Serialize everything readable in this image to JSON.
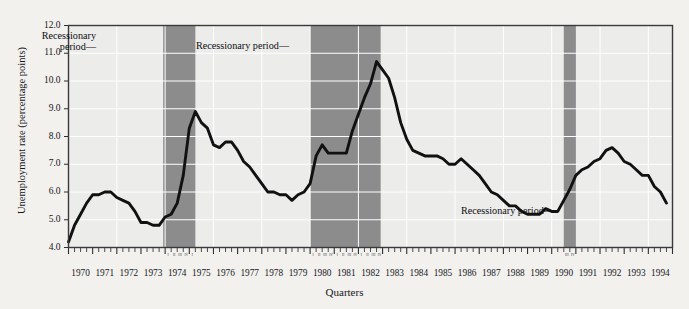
{
  "chart_data": {
    "type": "line",
    "title": "",
    "xlabel": "Quarters",
    "ylabel": "Unemployment rate (percentage points)",
    "ylim": [
      4.0,
      12.0
    ],
    "ytick_values": [
      4.0,
      5.0,
      6.0,
      7.0,
      8.0,
      9.0,
      10.0,
      11.0,
      12.0
    ],
    "ytick_labels": [
      "4.0",
      "5.0",
      "6.0",
      "7.0",
      "8.0",
      "9.0",
      "10.0",
      "11.0",
      "12.0"
    ],
    "xlim": [
      1970.0,
      1995.0
    ],
    "xtick_labels": [
      "1970",
      "1971",
      "1972",
      "1973",
      "1974",
      "1975",
      "1976",
      "1977",
      "1978",
      "1979",
      "1980",
      "1981",
      "1982",
      "1983",
      "1984",
      "1985",
      "1986",
      "1987",
      "1988",
      "1989",
      "1990",
      "1991",
      "1992",
      "1993",
      "1994"
    ],
    "grid": true,
    "legend": "none",
    "minor_ticks": "quarterly",
    "quarter_marks": [
      "I",
      "II",
      "III",
      "IV"
    ],
    "series": [
      {
        "name": "Unemployment rate",
        "color": "#111111",
        "x": [
          1970.0,
          1970.25,
          1970.5,
          1970.75,
          1971.0,
          1971.25,
          1971.5,
          1971.75,
          1972.0,
          1972.25,
          1972.5,
          1972.75,
          1973.0,
          1973.25,
          1973.5,
          1973.75,
          1974.0,
          1974.25,
          1974.5,
          1974.75,
          1975.0,
          1975.25,
          1975.5,
          1975.75,
          1976.0,
          1976.25,
          1976.5,
          1976.75,
          1977.0,
          1977.25,
          1977.5,
          1977.75,
          1978.0,
          1978.25,
          1978.5,
          1978.75,
          1979.0,
          1979.25,
          1979.5,
          1979.75,
          1980.0,
          1980.25,
          1980.5,
          1980.75,
          1981.0,
          1981.25,
          1981.5,
          1981.75,
          1982.0,
          1982.25,
          1982.5,
          1982.75,
          1983.0,
          1983.25,
          1983.5,
          1983.75,
          1984.0,
          1984.25,
          1984.5,
          1984.75,
          1985.0,
          1985.25,
          1985.5,
          1985.75,
          1986.0,
          1986.25,
          1986.5,
          1986.75,
          1987.0,
          1987.25,
          1987.5,
          1987.75,
          1988.0,
          1988.25,
          1988.5,
          1988.75,
          1989.0,
          1989.25,
          1989.5,
          1989.75,
          1990.0,
          1990.25,
          1990.5,
          1990.75,
          1991.0,
          1991.25,
          1991.5,
          1991.75,
          1992.0,
          1992.25,
          1992.5,
          1992.75,
          1993.0,
          1993.25,
          1993.5,
          1993.75,
          1994.0,
          1994.25,
          1994.5,
          1994.75
        ],
        "y": [
          4.2,
          4.8,
          5.2,
          5.6,
          5.9,
          5.9,
          6.0,
          6.0,
          5.8,
          5.7,
          5.6,
          5.3,
          4.9,
          4.9,
          4.8,
          4.8,
          5.1,
          5.2,
          5.6,
          6.6,
          8.3,
          8.9,
          8.5,
          8.3,
          7.7,
          7.6,
          7.8,
          7.8,
          7.5,
          7.1,
          6.9,
          6.6,
          6.3,
          6.0,
          6.0,
          5.9,
          5.9,
          5.7,
          5.9,
          6.0,
          6.3,
          7.3,
          7.7,
          7.4,
          7.4,
          7.4,
          7.4,
          8.2,
          8.8,
          9.4,
          9.9,
          10.7,
          10.4,
          10.1,
          9.4,
          8.5,
          7.9,
          7.5,
          7.4,
          7.3,
          7.3,
          7.3,
          7.2,
          7.0,
          7.0,
          7.2,
          7.0,
          6.8,
          6.6,
          6.3,
          6.0,
          5.9,
          5.7,
          5.5,
          5.5,
          5.3,
          5.2,
          5.2,
          5.2,
          5.4,
          5.3,
          5.3,
          5.7,
          6.1,
          6.6,
          6.8,
          6.9,
          7.1,
          7.2,
          7.5,
          7.6,
          7.4,
          7.1,
          7.0,
          6.8,
          6.6,
          6.6,
          6.2,
          6.0,
          5.6
        ]
      }
    ],
    "shaded_regions": [
      {
        "label": "Recessionary period",
        "x0": 1973.92,
        "x1": 1975.25,
        "color": "#8c8c8c"
      },
      {
        "label": "Recessionary period",
        "x0": 1980.0,
        "x1": 1982.92,
        "color": "#8c8c8c"
      },
      {
        "label": "Recessionary period",
        "x0": 1990.5,
        "x1": 1991.0,
        "color": "#8c8c8c"
      }
    ],
    "annotations": [
      {
        "text_line1": "Recessionary",
        "text_line2": "period—",
        "x_px": 96,
        "y_px": 30,
        "align": "right"
      },
      {
        "text_line1": "Recessionary period—",
        "text_line2": "",
        "x_px": 196,
        "y_px": 40,
        "align": "left"
      },
      {
        "text_line1": "Recessionary period—",
        "text_line2": "",
        "x_px": 461,
        "y_px": 205,
        "align": "left"
      }
    ]
  },
  "colors": {
    "page_background": "#f2f1ee",
    "plot_background": "#ececeb",
    "grid": "#ffffff",
    "shade": "#8c8c8c",
    "line": "#111111",
    "frame": "#3a3a3e",
    "text": "#16161a"
  }
}
